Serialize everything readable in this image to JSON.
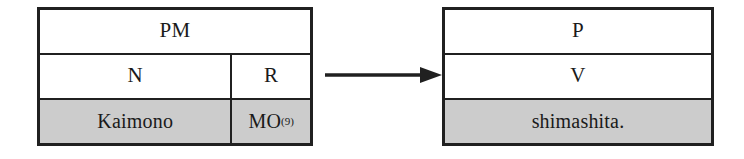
{
  "diagram": {
    "type": "linguistic-mapping-diagram",
    "colors": {
      "border": "#202020",
      "shaded_cell": "#cccccc",
      "background": "#ffffff",
      "text": "#1a1a1a"
    },
    "source_table": {
      "name": "source-structure",
      "rows": [
        {
          "name": "phrase-row",
          "cells": [
            {
              "label": "PM",
              "shaded": false,
              "span": "full"
            }
          ]
        },
        {
          "name": "category-row",
          "cells": [
            {
              "label": "N",
              "shaded": false,
              "span": "main"
            },
            {
              "label": "R",
              "shaded": false,
              "span": "side"
            }
          ]
        },
        {
          "name": "lexical-row",
          "cells": [
            {
              "label": "Kaimono",
              "shaded": true,
              "span": "main"
            },
            {
              "label": "MO",
              "footnote": "(9)",
              "shaded": true,
              "span": "side"
            }
          ]
        }
      ]
    },
    "connector": {
      "name": "mapping-arrow",
      "glyph": "arrow-right-icon",
      "direction": "right"
    },
    "target_table": {
      "name": "target-structure",
      "rows": [
        {
          "name": "phrase-row",
          "cells": [
            {
              "label": "P",
              "shaded": false,
              "span": "full"
            }
          ]
        },
        {
          "name": "category-row",
          "cells": [
            {
              "label": "V",
              "shaded": false,
              "span": "full"
            }
          ]
        },
        {
          "name": "lexical-row",
          "cells": [
            {
              "label": "shimashita.",
              "shaded": true,
              "span": "full"
            }
          ]
        }
      ]
    }
  }
}
